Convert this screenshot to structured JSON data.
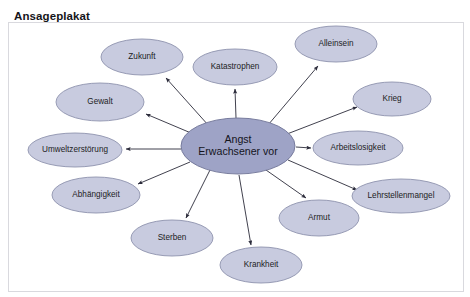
{
  "page": {
    "title": "Ansageplakat",
    "background_color": "#ffffff"
  },
  "diagram": {
    "type": "radial-mind-map",
    "frame": {
      "x": 8,
      "y": 22,
      "width": 455,
      "height": 272,
      "border_color": "#d9d9de"
    },
    "colors": {
      "center_fill": "#9ea3c6",
      "center_stroke": "#6f7496",
      "satellite_fill": "#c8cbdf",
      "satellite_stroke": "#8f93ae",
      "arrow": "#2b2b3a",
      "label_text": "#1d1d24"
    },
    "center": {
      "id": "center",
      "label_line_1": "Angst",
      "label_line_2": "Erwachsener vor",
      "cx": 238,
      "cy": 124,
      "rx": 57,
      "ry": 28
    },
    "satellites": [
      {
        "id": "zukunft",
        "label": "Zukunft",
        "cx": 142,
        "cy": 35,
        "rx": 41,
        "ry": 18
      },
      {
        "id": "katastrophen",
        "label": "Katastrophen",
        "cx": 235,
        "cy": 45,
        "rx": 42,
        "ry": 18
      },
      {
        "id": "alleinsein",
        "label": "Alleinsein",
        "cx": 336,
        "cy": 22,
        "rx": 41,
        "ry": 18
      },
      {
        "id": "krieg",
        "label": "Krieg",
        "cx": 392,
        "cy": 77,
        "rx": 39,
        "ry": 17
      },
      {
        "id": "arbeitslosigkeit",
        "label": "Arbeitslosigkeit",
        "cx": 358,
        "cy": 126,
        "rx": 45,
        "ry": 17
      },
      {
        "id": "lehrstellenmangel",
        "label": "Lehrstellenmangel",
        "cx": 401,
        "cy": 174,
        "rx": 49,
        "ry": 17
      },
      {
        "id": "armut",
        "label": "Armut",
        "cx": 319,
        "cy": 196,
        "rx": 40,
        "ry": 18
      },
      {
        "id": "krankheit",
        "label": "Krankheit",
        "cx": 261,
        "cy": 243,
        "rx": 41,
        "ry": 18
      },
      {
        "id": "sterben",
        "label": "Sterben",
        "cx": 172,
        "cy": 216,
        "rx": 41,
        "ry": 18
      },
      {
        "id": "abhaengigkeit",
        "label": "Abhängigkeit",
        "cx": 96,
        "cy": 173,
        "rx": 44,
        "ry": 18
      },
      {
        "id": "umweltzerstoerung",
        "label": "Umweltzerstörung",
        "cx": 75,
        "cy": 128,
        "rx": 47,
        "ry": 17
      },
      {
        "id": "gewalt",
        "label": "Gewalt",
        "cx": 100,
        "cy": 80,
        "rx": 44,
        "ry": 19
      }
    ],
    "arrows": [
      {
        "from": "center",
        "to": "zukunft",
        "x1": 209,
        "y1": 104,
        "x2": 166,
        "y2": 56
      },
      {
        "from": "center",
        "to": "katastrophen",
        "x1": 236,
        "y1": 96,
        "x2": 235,
        "y2": 67
      },
      {
        "from": "center",
        "to": "alleinsein",
        "x1": 268,
        "y1": 103,
        "x2": 318,
        "y2": 44
      },
      {
        "from": "center",
        "to": "krieg",
        "x1": 287,
        "y1": 112,
        "x2": 357,
        "y2": 85
      },
      {
        "from": "center",
        "to": "arbeitslosigkeit",
        "x1": 296,
        "y1": 125,
        "x2": 311,
        "y2": 126
      },
      {
        "from": "center",
        "to": "lehrstellenmangel",
        "x1": 288,
        "y1": 138,
        "x2": 357,
        "y2": 168
      },
      {
        "from": "center",
        "to": "armut",
        "x1": 266,
        "y1": 148,
        "x2": 306,
        "y2": 176
      },
      {
        "from": "center",
        "to": "krankheit",
        "x1": 239,
        "y1": 153,
        "x2": 251,
        "y2": 223
      },
      {
        "from": "center",
        "to": "sterben",
        "x1": 210,
        "y1": 148,
        "x2": 186,
        "y2": 196
      },
      {
        "from": "center",
        "to": "abhaengigkeit",
        "x1": 190,
        "y1": 140,
        "x2": 138,
        "y2": 162
      },
      {
        "from": "center",
        "to": "umweltzerstoerung",
        "x1": 181,
        "y1": 127,
        "x2": 126,
        "y2": 127
      },
      {
        "from": "center",
        "to": "gewalt",
        "x1": 191,
        "y1": 111,
        "x2": 146,
        "y2": 92
      }
    ]
  }
}
